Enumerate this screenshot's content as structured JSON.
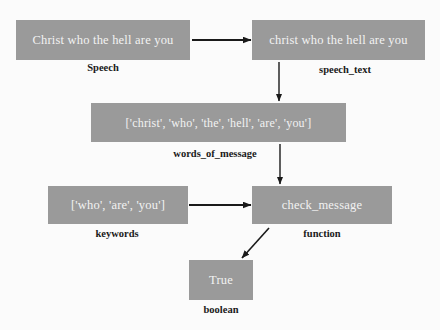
{
  "diagram": {
    "background_color": "#fbfbfb",
    "node_fill_color": "#9a9a9a",
    "node_text_color": "#f2f2f2",
    "label_text_color": "#1a1a1a",
    "arrow_color": "#1a1a1a",
    "nodes": [
      {
        "id": "speech",
        "value": "Christ who the hell are you",
        "label": "Speech"
      },
      {
        "id": "speech_text",
        "value": "christ who the hell are you",
        "label": "speech_text"
      },
      {
        "id": "words",
        "value": "['christ', 'who', 'the', 'hell', 'are', 'you']",
        "label": "words_of_message"
      },
      {
        "id": "keywords",
        "value": "['who', 'are', 'you']",
        "label": "keywords"
      },
      {
        "id": "check_message",
        "value": "check_message",
        "label": "function"
      },
      {
        "id": "boolean",
        "value": "True",
        "label": "boolean"
      }
    ],
    "edges": [
      {
        "from": "speech",
        "to": "speech_text",
        "kind": "horizontal-right"
      },
      {
        "from": "speech_text",
        "to": "words",
        "kind": "vertical-down"
      },
      {
        "from": "words",
        "to": "check_message",
        "kind": "vertical-down"
      },
      {
        "from": "keywords",
        "to": "check_message",
        "kind": "horizontal-right"
      },
      {
        "from": "check_message",
        "to": "boolean",
        "kind": "diagonal-down-left"
      }
    ]
  }
}
